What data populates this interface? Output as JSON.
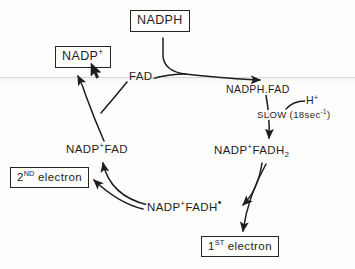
{
  "diagram": {
    "ink_color": "#1d1d1d",
    "background_color": "#fdfdfb",
    "nodes": {
      "nadph": {
        "label": "NADPH",
        "boxed": true
      },
      "nadp_plus": {
        "label_base": "NADP",
        "label_sup": "+",
        "boxed": true
      },
      "fad": {
        "label": "FAD",
        "boxed": false
      },
      "nadph_fad_complex": {
        "label": "NADPH.FAD",
        "boxed": false
      },
      "proton": {
        "label_base": "H",
        "label_sup": "+",
        "boxed": false
      },
      "slow_step": {
        "label": "SLOW (18sec",
        "label_sup": "-1",
        "label_tail": ")",
        "boxed": false
      },
      "nadp_fadh2": {
        "label_base": "NADP",
        "label_sup": "+",
        "label_mid": "FADH",
        "label_sub": "2",
        "boxed": false
      },
      "nadp_fad": {
        "label_base": "NADP",
        "label_sup": "+",
        "label_tail": "FAD",
        "boxed": false
      },
      "second_electron": {
        "ordinal_num": "2",
        "ordinal_sup": "ND",
        "label_tail": "electron",
        "boxed": true
      },
      "nadp_fadh_radical": {
        "label_base": "NADP",
        "label_sup": "+",
        "label_mid": "FADH",
        "label_radical": "•",
        "boxed": false
      },
      "first_electron": {
        "ordinal_num": "1",
        "ordinal_sup": "ST",
        "label_tail": "electron",
        "boxed": true
      }
    }
  },
  "cursor": {
    "name": "mouse-pointer",
    "x": 90,
    "y": 62
  }
}
